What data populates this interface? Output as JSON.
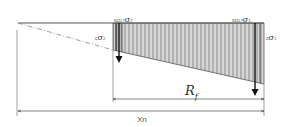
{
  "diagram": {
    "labels": {
      "top_left_prefix": "scu r",
      "top_left_symbol": "σ",
      "top_left_sub": "2",
      "top_right_prefix": "scu r",
      "top_right_symbol": "σ",
      "top_right_sub": "1",
      "side_left_prefix": "c",
      "side_left_symbol": "σ",
      "side_left_sub": "2",
      "side_right_prefix": "c",
      "side_right_symbol": "σ",
      "side_right_sub": "1",
      "rf_main": "R",
      "rf_sub": "f",
      "xn": "Xn"
    },
    "colors": {
      "line": "#555555",
      "hatch": "#7a7a7a",
      "arrow": "#111111",
      "dash": "#888888"
    }
  }
}
